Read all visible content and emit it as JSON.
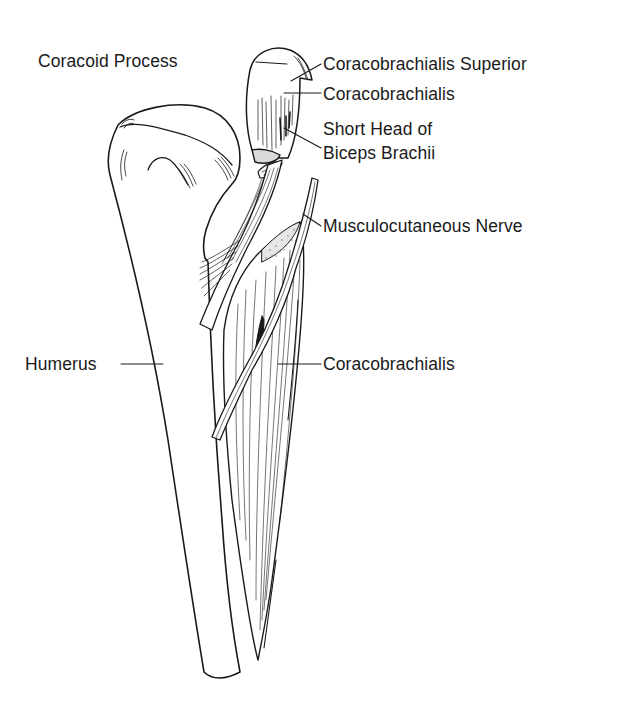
{
  "diagram": {
    "colors": {
      "ink": "#1a1a1a",
      "background": "#ffffff"
    },
    "labels": {
      "coracoid_process": "Coracoid Process",
      "coracobrachialis_superior": "Coracobrachialis Superior",
      "coracobrachialis_upper": "Coracobrachialis",
      "short_head_line1": "Short Head of",
      "short_head_line2": "Biceps Brachii",
      "musculocutaneous_nerve": "Musculocutaneous Nerve",
      "humerus": "Humerus",
      "coracobrachialis_lower": "Coracobrachialis"
    }
  }
}
